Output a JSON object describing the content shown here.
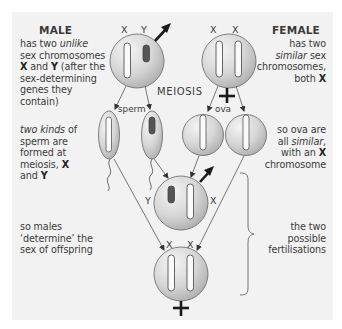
{
  "male": {
    "heading": "MALE",
    "desc_line1_pre": "has two ",
    "desc_line1_em": "unlike",
    "desc_line2": "sex chromosomes",
    "desc_line3_b1": "X",
    "desc_line3_mid": " and ",
    "desc_line3_b2": "Y",
    "desc_line3_post": " (after the",
    "desc_line4": "sex-determining",
    "desc_line5": "genes they",
    "desc_line6": "contain)",
    "chromosome_labels": [
      "X",
      "Y"
    ]
  },
  "female": {
    "heading": "FEMALE",
    "desc_line1": "has two",
    "desc_line2_em": "similar",
    "desc_line2_post": " sex",
    "desc_line3": "chromosomes,",
    "desc_line4_pre": "both ",
    "desc_line4_b": "X",
    "chromosome_labels": [
      "X",
      "X"
    ]
  },
  "meiosis_label": "MEIOSIS",
  "sperm_label": "sperm",
  "ova_label": "ova",
  "sperm_text": {
    "line1_em": "two kinds",
    "line1_post": " of",
    "line2": "sperm are",
    "line3": "formed at",
    "line4_pre": "meiosis, ",
    "line4_b": "X",
    "line5_pre": "and ",
    "line5_b": "Y"
  },
  "ova_text": {
    "line1": "so ova are",
    "line2_pre": "all ",
    "line2_em": "similar",
    "line2_post": ",",
    "line3_pre": "with an ",
    "line3_b": "X",
    "line4": "chromosome"
  },
  "males_determine_text": {
    "line1": "so males",
    "line2": "‘determine’ the",
    "line3": "sex of offspring"
  },
  "fertilisations_text": {
    "line1": "the two",
    "line2": "possible",
    "line3": "fertilisations"
  },
  "offspring_male": {
    "chromosome_labels": [
      "Y",
      "X"
    ]
  },
  "offspring_female": {
    "chromosome_labels": [
      "X",
      "X"
    ]
  },
  "colors": {
    "panel": "#f2f2f2",
    "cell_light": "#f2f2f2",
    "cell_dark": "#a8a8a8",
    "y_chromosome": "#555555",
    "outline": "#555555",
    "symbol": "#1a1a1a"
  }
}
